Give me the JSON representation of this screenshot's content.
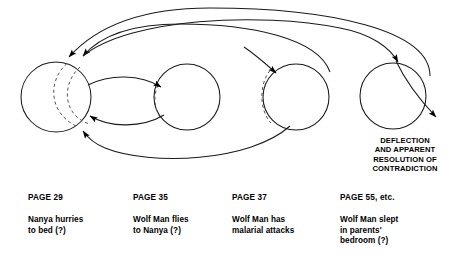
{
  "figure": {
    "type": "flow-diagram",
    "background_color": "#ffffff",
    "line_color": "#1a1a1a",
    "dashed_color": "#555555"
  },
  "annotation": {
    "deflection_text": "DEFLECTION\nAND APPARENT\nRESOLUTION OF\nCONTRADICTION"
  },
  "nodes": [
    {
      "id": "node-1",
      "title": "PAGE 29",
      "body": "Nanya hurries\nto bed (?)",
      "cx": 56,
      "cy": 97,
      "r": 35
    },
    {
      "id": "node-2",
      "title": "PAGE 35",
      "body": "Wolf Man flies\nto Nanya (?)",
      "cx": 187,
      "cy": 97,
      "r": 33
    },
    {
      "id": "node-3",
      "title": "PAGE 37",
      "body": "Wolf Man has\nmalarial attacks",
      "cx": 296,
      "cy": 97,
      "r": 33
    },
    {
      "id": "node-4",
      "title": "PAGE 55, etc.",
      "body": "Wolf Man slept\nin parents'\nbedroom (?)",
      "cx": 393,
      "cy": 96,
      "r": 33
    }
  ],
  "edges": [
    {
      "id": "edge-outer-return",
      "from": "node-4",
      "to": "node-1",
      "style": "solid",
      "note": "long upper arc returning to node 1"
    },
    {
      "id": "edge-inner-return",
      "from": "node-3",
      "to": "node-1",
      "style": "solid",
      "note": "upper arc returning to node 1"
    },
    {
      "id": "edge-1-to-2",
      "from": "node-1",
      "to": "node-2",
      "style": "solid",
      "note": "upper lens arc"
    },
    {
      "id": "edge-2-to-1",
      "from": "node-2",
      "to": "node-1",
      "style": "solid",
      "note": "lower lens arc"
    },
    {
      "id": "edge-2-to-3",
      "from": "node-2",
      "to": "node-3",
      "style": "solid",
      "note": "descending arc into node 3 upper left"
    },
    {
      "id": "edge-3-to-1",
      "from": "node-3",
      "to": "node-1",
      "style": "solid",
      "note": "long lower arc returning to node 1"
    },
    {
      "id": "edge-1-to-4",
      "from": "node-1",
      "to": "node-4",
      "style": "solid",
      "note": "long top arc descending into node 4"
    },
    {
      "id": "edge-4-out",
      "from": "node-4",
      "to": "deflection",
      "style": "solid",
      "note": "arc exiting node 4 to lower right"
    }
  ],
  "dashed_arcs": [
    {
      "id": "dashed-node-1-a",
      "in_node": "node-1"
    },
    {
      "id": "dashed-node-1-b",
      "in_node": "node-1"
    },
    {
      "id": "dashed-node-2",
      "in_node": "node-2"
    },
    {
      "id": "dashed-node-3",
      "in_node": "node-3"
    }
  ],
  "captions": {
    "row_title_y": 196,
    "row_body_y": 196,
    "columns_x": [
      28,
      133,
      232,
      340
    ]
  }
}
